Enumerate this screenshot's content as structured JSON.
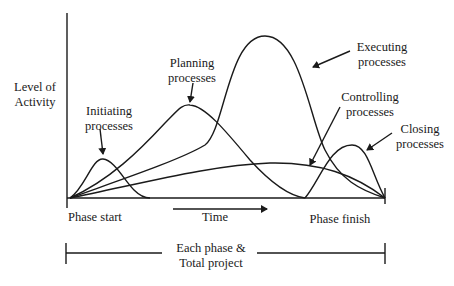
{
  "diagram": {
    "y_axis_label": [
      "Level of",
      "Activity"
    ],
    "x_axis": {
      "start_label": "Phase start",
      "time_label": "Time",
      "finish_label": "Phase finish"
    },
    "bracket_label": [
      "Each phase &",
      "Total project"
    ],
    "curves": [
      {
        "id": "initiating",
        "label": [
          "Initiating",
          "processes"
        ]
      },
      {
        "id": "planning",
        "label": [
          "Planning",
          "processes"
        ]
      },
      {
        "id": "executing",
        "label": [
          "Executing",
          "processes"
        ]
      },
      {
        "id": "controlling",
        "label": [
          "Controlling",
          "processes"
        ]
      },
      {
        "id": "closing",
        "label": [
          "Closing",
          "processes"
        ]
      }
    ],
    "line_color": "#1a1a1a",
    "background": "#ffffff"
  }
}
